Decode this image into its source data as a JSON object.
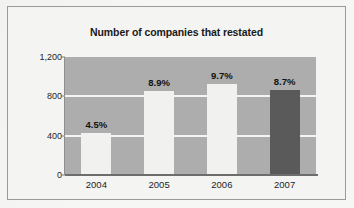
{
  "chart_data": {
    "type": "bar",
    "title": "Number of companies that restated",
    "xlabel": "",
    "ylabel": "",
    "categories": [
      "2004",
      "2005",
      "2006",
      "2007"
    ],
    "values": [
      425,
      855,
      925,
      865
    ],
    "data_labels": [
      "4.5%",
      "8.9%",
      "9.7%",
      "8.7%"
    ],
    "bar_styles": [
      "light",
      "light",
      "light",
      "dark"
    ],
    "ylim": [
      0,
      1200
    ],
    "yticks": [
      0,
      400,
      800,
      1200
    ],
    "ytick_labels": [
      "0",
      "400",
      "800",
      "1,200"
    ],
    "grid": true,
    "gridlines_at": [
      400,
      800
    ],
    "legend": null,
    "legend_position": "none",
    "colors": {
      "plot_background": "#adadad",
      "bar_light": "#f1f1ef",
      "bar_dark": "#5a5a5a",
      "gridline": "#f4f4f2",
      "axis": "#6d6d6d",
      "text": "#1a1a1a",
      "frame_border": "#9a9a9a",
      "page_background": "#f4f4f3"
    }
  }
}
